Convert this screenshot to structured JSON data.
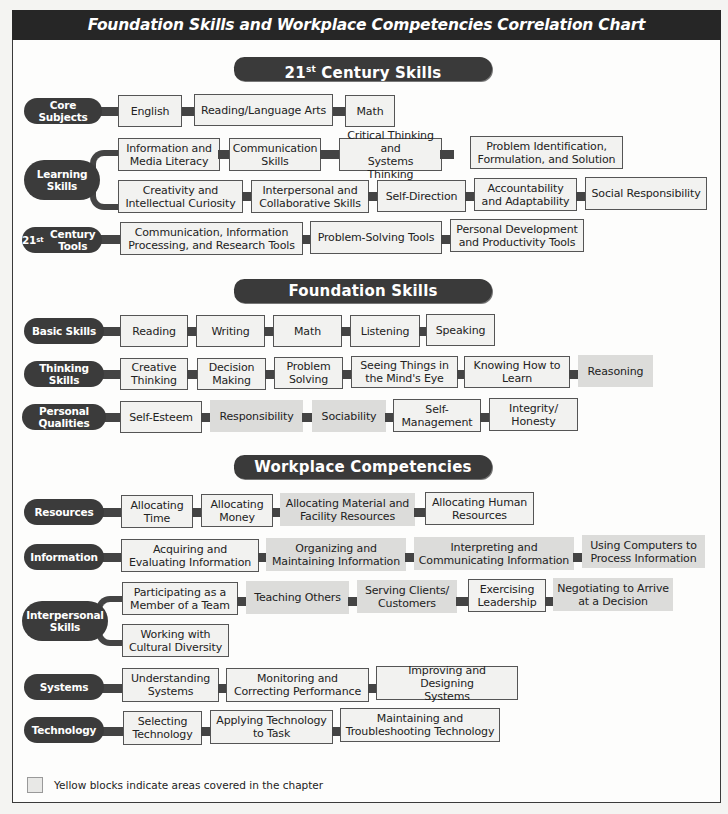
{
  "title": "Foundation Skills and Workplace Competencies Correlation Chart",
  "colors": {
    "header": "#262626",
    "category": "#3b3b3b",
    "plain_box": "#f2f2f0",
    "highlight_box": "#dcdcda",
    "connector": "#444444"
  },
  "sections": {
    "century": {
      "title_main": "21",
      "title_sup": "st",
      "title_rest": " Century Skills",
      "rows": {
        "core": {
          "label": "Core Subjects",
          "items": [
            "English",
            "Reading/Language Arts",
            "Math"
          ]
        },
        "learning": {
          "label": "Learning\nSkills",
          "items": [
            "Information and\nMedia Literacy",
            "Communication\nSkills",
            "Critical Thinking and\nSystems Thinking",
            "Problem Identification,\nFormulation, and Solution",
            "Creativity and\nIntellectual Curiosity",
            "Interpersonal and\nCollaborative Skills",
            "Self-Direction",
            "Accountability\nand Adaptability",
            "Social Responsibility"
          ]
        },
        "tools": {
          "label_main": "21",
          "label_sup": "st",
          "label_rest": " Century Tools",
          "items": [
            "Communication, Information\nProcessing, and Research Tools",
            "Problem-Solving Tools",
            "Personal Development\nand Productivity Tools"
          ]
        }
      }
    },
    "foundation": {
      "title": "Foundation Skills",
      "rows": {
        "basic": {
          "label": "Basic Skills",
          "items": [
            "Reading",
            "Writing",
            "Math",
            "Listening",
            "Speaking"
          ]
        },
        "thinking": {
          "label": "Thinking Skills",
          "items": [
            "Creative\nThinking",
            "Decision\nMaking",
            "Problem\nSolving",
            "Seeing Things in\nthe Mind's Eye",
            "Knowing How to\nLearn",
            "Reasoning"
          ]
        },
        "personal": {
          "label": "Personal Qualities",
          "items": [
            "Self-Esteem",
            "Responsibility",
            "Sociability",
            "Self-\nManagement",
            "Integrity/\nHonesty"
          ]
        }
      }
    },
    "workplace": {
      "title": "Workplace Competencies",
      "rows": {
        "resources": {
          "label": "Resources",
          "items": [
            "Allocating\nTime",
            "Allocating\nMoney",
            "Allocating Material and\nFacility Resources",
            "Allocating Human\nResources"
          ]
        },
        "information": {
          "label": "Information",
          "items": [
            "Acquiring and\nEvaluating Information",
            "Organizing and\nMaintaining Information",
            "Interpreting and\nCommunicating Information",
            "Using Computers to\nProcess Information"
          ]
        },
        "interpersonal": {
          "label": "Interpersonal\nSkills",
          "items": [
            "Participating as a\nMember of a Team",
            "Teaching Others",
            "Serving Clients/\nCustomers",
            "Exercising\nLeadership",
            "Negotiating to Arrive\nat a Decision",
            "Working with\nCultural Diversity"
          ]
        },
        "systems": {
          "label": "Systems",
          "items": [
            "Understanding\nSystems",
            "Monitoring and\nCorrecting Performance",
            "Improving and Designing\nSystems"
          ]
        },
        "technology": {
          "label": "Technology",
          "items": [
            "Selecting\nTechnology",
            "Applying Technology\nto Task",
            "Maintaining and\nTroubleshooting Technology"
          ]
        }
      }
    }
  },
  "legend": {
    "text": "Yellow blocks indicate areas covered in the chapter"
  }
}
